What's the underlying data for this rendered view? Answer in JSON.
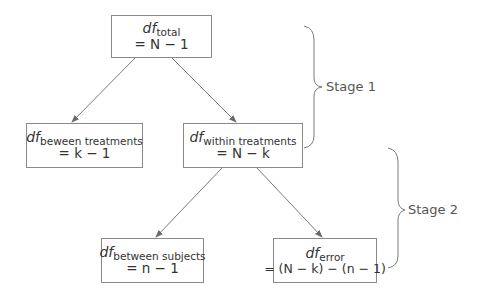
{
  "diagram": {
    "type": "tree",
    "nodes": [
      {
        "id": "total",
        "df_label": "df",
        "subscript": "total",
        "formula": "= N − 1"
      },
      {
        "id": "between_treatments",
        "df_label": "df",
        "subscript": "beween treatments",
        "formula": "= k − 1"
      },
      {
        "id": "within_treatments",
        "df_label": "df",
        "subscript": "within treatments",
        "formula": "= N − k"
      },
      {
        "id": "between_subjects",
        "df_label": "df",
        "subscript": "between subjects",
        "formula": "= n − 1"
      },
      {
        "id": "error",
        "df_label": "df",
        "subscript": "error",
        "formula": "= (N − k) − (n − 1)"
      }
    ],
    "edges": [
      {
        "from": "total",
        "to": "between_treatments"
      },
      {
        "from": "total",
        "to": "within_treatments"
      },
      {
        "from": "within_treatments",
        "to": "between_subjects"
      },
      {
        "from": "within_treatments",
        "to": "error"
      }
    ],
    "stages": [
      {
        "label": "Stage 1",
        "spans": [
          "total",
          "within_treatments"
        ]
      },
      {
        "label": "Stage 2",
        "spans": [
          "within_treatments",
          "error"
        ]
      }
    ],
    "colors": {
      "line": "#7a7a7a",
      "box_border": "#8a8a8a",
      "text": "#333333"
    }
  }
}
